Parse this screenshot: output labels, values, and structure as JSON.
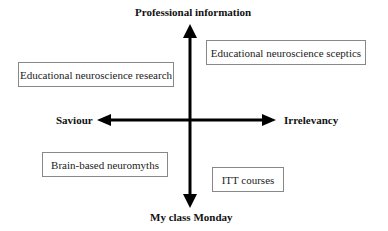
{
  "axes": {
    "top": "Professional information",
    "bottom": "My class Monday",
    "left": "Saviour",
    "right": "Irrelevancy"
  },
  "boxes": [
    {
      "label": "Educational neuroscience research",
      "quadrant": "top-left"
    },
    {
      "label": "Educational neuroscience sceptics",
      "quadrant": "top-right"
    },
    {
      "label": "Brain-based neuromyths",
      "quadrant": "bottom-left"
    },
    {
      "label": "ITT courses",
      "quadrant": "bottom-right"
    }
  ],
  "colors": {
    "arrow": "#000000",
    "box_border": "#888888"
  }
}
